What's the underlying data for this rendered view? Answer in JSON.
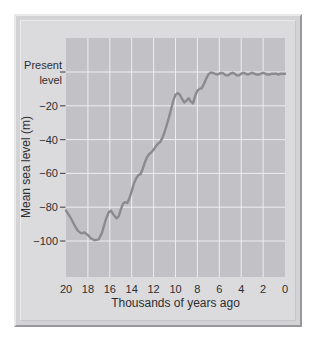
{
  "chart_data": {
    "type": "line",
    "title": "",
    "xlabel": "Thousands of years ago",
    "ylabel": "Mean sea level (m)",
    "x_ticks": [
      20,
      18,
      16,
      14,
      12,
      10,
      8,
      6,
      4,
      2,
      0
    ],
    "y_ticks": [
      {
        "value": 0,
        "label": "Present level",
        "two_line": true
      },
      {
        "value": -20,
        "label": "−20"
      },
      {
        "value": -40,
        "label": "−40"
      },
      {
        "value": -60,
        "label": "−60"
      },
      {
        "value": -80,
        "label": "−80"
      },
      {
        "value": -100,
        "label": "−100"
      }
    ],
    "x_range": [
      20,
      0
    ],
    "ylim": [
      -121,
      20
    ],
    "grid": true,
    "legend": false,
    "series": [
      {
        "name": "Mean sea level",
        "x": [
          20,
          19.6,
          19.2,
          18.9,
          18.6,
          18.3,
          18.0,
          17.7,
          17.4,
          17.0,
          16.7,
          16.4,
          16.1,
          15.9,
          15.7,
          15.4,
          15.2,
          15.0,
          14.8,
          14.6,
          14.4,
          14.2,
          14.0,
          13.8,
          13.6,
          13.4,
          13.2,
          13.0,
          12.8,
          12.6,
          12.4,
          12.2,
          12.0,
          11.8,
          11.6,
          11.4,
          11.2,
          11.0,
          10.8,
          10.6,
          10.4,
          10.2,
          10.0,
          9.8,
          9.6,
          9.4,
          9.2,
          9.0,
          8.8,
          8.6,
          8.4,
          8.2,
          8.0,
          7.8,
          7.6,
          7.4,
          7.2,
          7.0,
          6.8,
          6.6,
          6.4,
          6.2,
          6.0,
          5.8,
          5.6,
          5.4,
          5.2,
          5.0,
          4.8,
          4.6,
          4.4,
          4.2,
          4.0,
          3.8,
          3.6,
          3.4,
          3.2,
          3.0,
          2.8,
          2.6,
          2.4,
          2.2,
          2.0,
          1.8,
          1.6,
          1.4,
          1.2,
          1.0,
          0.8,
          0.6,
          0.4,
          0.2,
          0.0
        ],
        "y": [
          -82,
          -86,
          -91,
          -94,
          -95.5,
          -95,
          -96.5,
          -98.5,
          -99.5,
          -99,
          -95,
          -88,
          -83,
          -82,
          -84,
          -86.5,
          -85.5,
          -81.5,
          -78,
          -77,
          -77.5,
          -74.5,
          -70.5,
          -66,
          -63,
          -61,
          -60.5,
          -57.5,
          -53.5,
          -50.5,
          -48.5,
          -47.5,
          -46,
          -44,
          -42.5,
          -41.5,
          -39,
          -35.5,
          -31.5,
          -27,
          -22,
          -17,
          -13.5,
          -12.5,
          -13.5,
          -16,
          -18,
          -17,
          -15.5,
          -17.5,
          -18.5,
          -14,
          -11,
          -10,
          -9.5,
          -7,
          -4,
          -1.5,
          -0.5,
          -0.5,
          -1,
          -1.5,
          -1,
          -0.5,
          -1,
          -2,
          -2,
          -1,
          -0.5,
          -1,
          -2,
          -2,
          -1,
          -0.5,
          -1,
          -1.5,
          -1,
          -0.5,
          -1,
          -1.5,
          -1.5,
          -1,
          -0.5,
          -1,
          -1.5,
          -1.5,
          -1,
          -1,
          -1,
          -1.5,
          -1,
          -1,
          -1
        ]
      }
    ],
    "colors": {
      "line": "#8a8a8f",
      "plot_bg": "#c2c2c6",
      "grid": "#eeeef0",
      "panel_bg": "#dbdbde",
      "frame_bg": "#d3d3d6",
      "frame_highlight": "#e9e9eb",
      "frame_shadow": "#98989c",
      "text": "#2e2e30",
      "tick": "#55555a"
    }
  }
}
